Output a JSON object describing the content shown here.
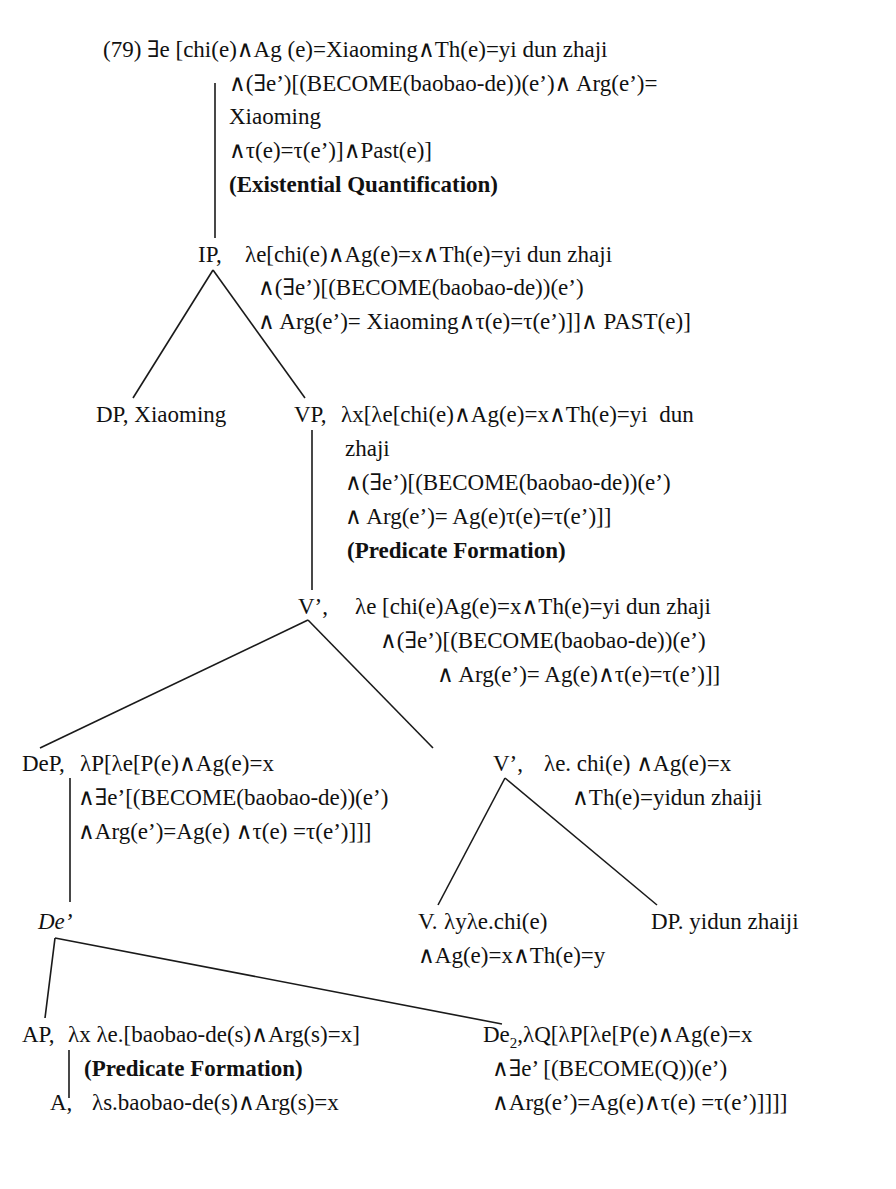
{
  "example_number": "(79)",
  "nodes": {
    "root": {
      "lines": [
        "(79) ∃e [chi(e)∧Ag (e)=Xiaoming∧Th(e)=yi dun zhaji",
        "∧(∃e’)[(BECOME(baobao-de))(e’)∧ Arg(e’)=",
        "Xiaoming",
        "∧τ(e)=τ(e’)]∧Past(e)]"
      ],
      "rule": "(Existential Quantification)"
    },
    "ip": {
      "label": "IP,",
      "lines": [
        "λe[chi(e)∧Ag(e)=x∧Th(e)=yi dun zhaji",
        "∧(∃e’)[(BECOME(baobao-de))(e’)",
        "∧ Arg(e’)= Xiaoming∧τ(e)=τ(e’)]]∧ PAST(e)]"
      ]
    },
    "dp_subject": {
      "label": "DP, Xiaoming"
    },
    "vp": {
      "label": "VP,",
      "lines": [
        "λx[λe[chi(e)∧Ag(e)=x∧Th(e)=yi  dun",
        "zhaji",
        "∧(∃e’)[(BECOME(baobao-de))(e’)",
        "∧ Arg(e’)= Ag(e)τ(e)=τ(e’)]]"
      ],
      "rule": "(Predicate Formation)"
    },
    "vbar_upper": {
      "label": "V’,",
      "lines": [
        "λe [chi(e)Ag(e)=x∧Th(e)=yi dun zhaji",
        "∧(∃e’)[(BECOME(baobao-de))(e’)",
        "∧ Arg(e’)= Ag(e)∧τ(e)=τ(e’)]]"
      ]
    },
    "dep": {
      "label": "DeP,",
      "lines": [
        "λP[λe[P(e)∧Ag(e)=x",
        "∧∃e’[(BECOME(baobao-de))(e’)",
        "∧Arg(e’)=Ag(e) ∧τ(e) =τ(e’)]]]"
      ]
    },
    "vbar_lower": {
      "label": "V’,",
      "lines": [
        "λe. chi(e) ∧Ag(e)=x",
        "∧Th(e)=yidun zhaiji"
      ]
    },
    "de_bar": {
      "label": "De’"
    },
    "v": {
      "label": "V.",
      "lines": [
        "λyλe.chi(e)",
        "∧Ag(e)=x∧Th(e)=y"
      ]
    },
    "dp_object": {
      "label": "DP. yidun zhaiji"
    },
    "ap": {
      "label": "AP,",
      "lines": [
        "λx λe.[baobao-de(s)∧Arg(s)=x]"
      ],
      "rule": "(Predicate Formation)"
    },
    "de2": {
      "label": "De",
      "subscript": "2",
      "lines": [
        ",λQ[λP[λe[P(e)∧Ag(e)=x",
        "∧∃e’ [(BECOME(Q))(e’)",
        "∧Arg(e’)=Ag(e)∧τ(e) =τ(e’)]]]]"
      ]
    },
    "a": {
      "label": "A,",
      "lines": [
        "λs.baobao-de(s)∧Arg(s)=x"
      ]
    }
  }
}
